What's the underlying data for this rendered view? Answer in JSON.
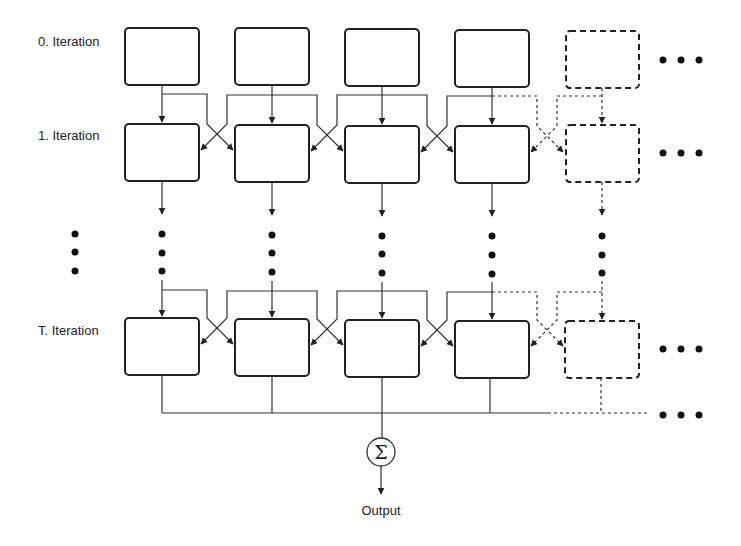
{
  "diagram": {
    "type": "iterative processing grid with cross connections",
    "row_labels": [
      "0. Iteration",
      "1. Iteration",
      "T. Iteration"
    ],
    "output_label": "Output",
    "sum_symbol": "Σ",
    "columns": 5,
    "solid_columns": 4,
    "dashed_columns": 1,
    "continuation_marker": "• • •",
    "colors": {
      "stroke": "#222222",
      "background": "#ffffff"
    }
  }
}
